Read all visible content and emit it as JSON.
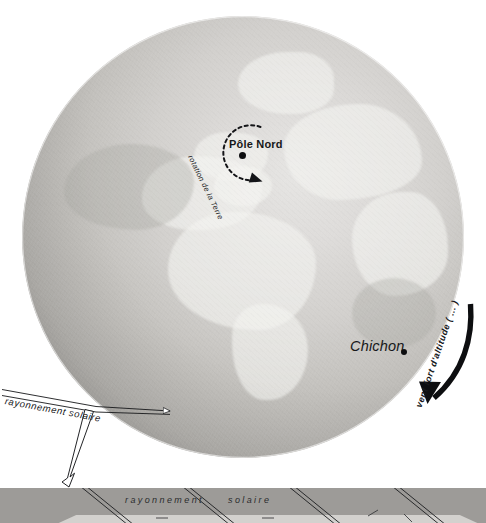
{
  "figure": {
    "background_color": "#ffffff",
    "width": 486,
    "height": 523
  },
  "globe": {
    "name": "earth-polar-view",
    "pole_label": "Pôle Nord",
    "rotation_label": "rotation de la Terre",
    "volcano_label": "Chichon",
    "colors": {
      "sphere_light": "#e6e5e3",
      "sphere_mid": "#c2c0bc",
      "sphere_dark": "#807e7a",
      "aerosol_band": "#8a8885",
      "land": "#f4f3f1"
    }
  },
  "annotations": {
    "solar_radiation": "rayonnement solaire",
    "high_altitude_wind": "vent fort d'altitude ( ... )"
  },
  "panel": {
    "label_left": "rayonnement",
    "label_right": "solaire",
    "background_color": "#9d9b98",
    "floor_color": "#d3d1ce"
  }
}
